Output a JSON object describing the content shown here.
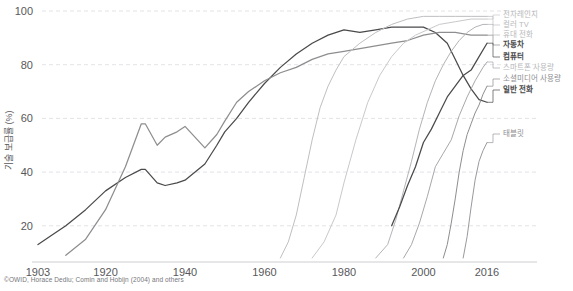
{
  "chart_data": {
    "type": "line",
    "title": "",
    "xlabel": "",
    "ylabel": "기술 보급률 (%)",
    "xlim": [
      1903,
      2016
    ],
    "ylim": [
      8,
      100
    ],
    "grid": true,
    "legend_position": "right",
    "xticks": [
      "1903",
      "1920",
      "1940",
      "1960",
      "1980",
      "2000",
      "2016"
    ],
    "xtick_values": [
      1903,
      1920,
      1940,
      1960,
      1980,
      2000,
      2016
    ],
    "yticks": [
      "20",
      "40",
      "60",
      "80",
      "100"
    ],
    "ytick_values": [
      20,
      40,
      60,
      80,
      100
    ],
    "source": "©OWID, Horace Dediu; Comin and Hobijn (2004) and others",
    "series": [
      {
        "name": "일반 전화",
        "label": "일반 전화",
        "color": "#4a4a4c",
        "weight": "bold",
        "x": [
          1903,
          1907,
          1910,
          1915,
          1920,
          1925,
          1929,
          1930,
          1933,
          1935,
          1938,
          1940,
          1945,
          1948,
          1950,
          1953,
          1956,
          1960,
          1964,
          1968,
          1972,
          1976,
          1980,
          1984,
          1988,
          1992,
          1996,
          2000,
          2003,
          2006,
          2008,
          2010,
          2012,
          2014,
          2016
        ],
        "y": [
          13,
          17,
          20,
          26,
          33,
          38,
          41,
          41,
          36,
          35,
          36,
          37,
          43,
          50,
          55,
          60,
          66,
          73,
          79,
          84,
          88,
          91,
          93,
          92,
          93,
          94,
          94,
          94,
          92,
          88,
          82,
          76,
          71,
          67,
          66
        ]
      },
      {
        "name": "자동차",
        "label": "자동차",
        "color": "#8e8e90",
        "weight": "bold",
        "x": [
          1910,
          1915,
          1920,
          1925,
          1929,
          1930,
          1933,
          1935,
          1938,
          1940,
          1945,
          1948,
          1950,
          1953,
          1956,
          1960,
          1964,
          1968,
          1972,
          1976,
          1980,
          1984,
          1988,
          1992,
          1996,
          2000,
          2004,
          2008,
          2012,
          2016
        ],
        "y": [
          9,
          15,
          26,
          42,
          58,
          58,
          50,
          53,
          55,
          57,
          49,
          54,
          59,
          66,
          70,
          74,
          77,
          79,
          82,
          84,
          85,
          86,
          87,
          88,
          89,
          91,
          92,
          92,
          91,
          91
        ]
      },
      {
        "name": "컬러 TV",
        "label": "컬러 TV",
        "color": "#bfbfc2",
        "weight": "light",
        "x": [
          1964,
          1966,
          1968,
          1970,
          1972,
          1974,
          1976,
          1978,
          1980,
          1984,
          1988,
          1992,
          1996,
          2000,
          2004,
          2008,
          2012,
          2016
        ],
        "y": [
          8,
          14,
          24,
          38,
          52,
          64,
          72,
          78,
          83,
          88,
          92,
          95,
          97,
          98,
          98,
          98,
          98,
          98
        ]
      },
      {
        "name": "전자레인지",
        "label": "전자레인지",
        "color": "#c9c9cc",
        "weight": "light",
        "x": [
          1972,
          1975,
          1978,
          1980,
          1983,
          1986,
          1989,
          1992,
          1995,
          1998,
          2001,
          2004,
          2008,
          2012,
          2016
        ],
        "y": [
          8,
          14,
          24,
          36,
          52,
          66,
          76,
          83,
          88,
          91,
          93,
          95,
          96,
          97,
          97
        ]
      },
      {
        "name": "휴대 전화",
        "label": "휴대 전화",
        "color": "#b4b4b8",
        "weight": "light",
        "x": [
          1988,
          1991,
          1993,
          1995,
          1997,
          1999,
          2001,
          2003,
          2005,
          2007,
          2009,
          2011,
          2013,
          2015,
          2016
        ],
        "y": [
          8,
          13,
          22,
          33,
          44,
          56,
          66,
          74,
          80,
          85,
          89,
          92,
          94,
          95,
          95
        ]
      },
      {
        "name": "컴퓨터",
        "label": "컴퓨터",
        "color": "#4a4a4c",
        "weight": "bold",
        "x": [
          1992,
          1994,
          1996,
          1998,
          2000,
          2002,
          2004,
          2006,
          2008,
          2010,
          2012,
          2014,
          2016
        ],
        "y": [
          20,
          27,
          35,
          42,
          51,
          56,
          62,
          68,
          72,
          76,
          78,
          83,
          88
        ]
      },
      {
        "name": "스마트폰 사용량",
        "label": "스마트폰 사용량",
        "color": "#a8a8ac",
        "weight": "light",
        "x": [
          1995,
          1997,
          1999,
          2001,
          2003,
          2005,
          2007,
          2009,
          2011,
          2013,
          2015,
          2016
        ],
        "y": [
          8,
          13,
          21,
          31,
          42,
          47,
          52,
          61,
          68,
          74,
          79,
          81
        ]
      },
      {
        "name": "소셜미디어 사용량",
        "label": "소셜미디어 사용량",
        "color": "#8e8e90",
        "weight": "mid",
        "x": [
          2005,
          2006,
          2007,
          2008,
          2009,
          2010,
          2011,
          2012,
          2013,
          2014,
          2015,
          2016
        ],
        "y": [
          8,
          13,
          21,
          30,
          40,
          48,
          54,
          58,
          62,
          65,
          69,
          72
        ]
      },
      {
        "name": "태블릿",
        "label": "태블릿",
        "color": "#9a9a9e",
        "weight": "mid",
        "x": [
          2010,
          2011,
          2012,
          2013,
          2014,
          2015,
          2016
        ],
        "y": [
          8,
          16,
          27,
          37,
          44,
          48,
          51
        ]
      }
    ],
    "legend_entries": [
      {
        "label": "전자레인지",
        "weight": "light"
      },
      {
        "label": "컬러 TV",
        "weight": "light"
      },
      {
        "label": "휴대 전화",
        "weight": "light"
      },
      {
        "label": "자동차",
        "weight": "bold"
      },
      {
        "label": "컴퓨터",
        "weight": "bold"
      },
      {
        "label": "스마트폰 사용량",
        "weight": "light"
      },
      {
        "label": "소셜미디어 사용량",
        "weight": "mid"
      },
      {
        "label": "일반 전화",
        "weight": "bold"
      },
      {
        "label": "태블릿",
        "weight": "mid"
      }
    ]
  }
}
